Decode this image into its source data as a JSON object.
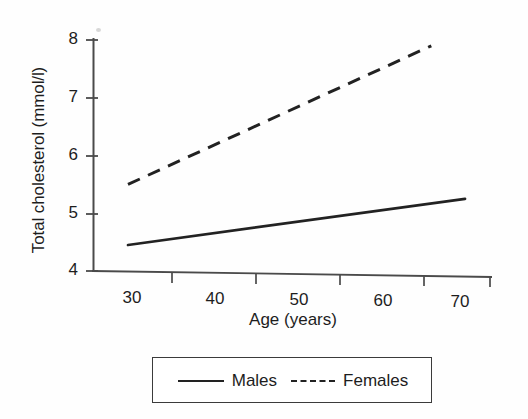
{
  "chart_data": {
    "type": "line",
    "title": "",
    "xlabel": "Age (years)",
    "ylabel": "Total cholesterol (mmol/l)",
    "xlim": [
      25,
      75
    ],
    "ylim": [
      4,
      8
    ],
    "xticks": [
      30,
      40,
      50,
      60,
      70
    ],
    "xtick_labels": [
      "30",
      "40",
      "50",
      "60",
      "70"
    ],
    "yticks": [
      4,
      5,
      6,
      7,
      8
    ],
    "ytick_labels": [
      "4",
      "5",
      "6",
      "7",
      "8"
    ],
    "grid": false,
    "legend_position": "below-axes",
    "series": [
      {
        "name": "Males",
        "style": "solid",
        "color": "#222222",
        "x": [
          30,
          70
        ],
        "values": [
          4.45,
          5.25
        ]
      },
      {
        "name": "Females",
        "style": "dashed",
        "color": "#222222",
        "x": [
          30,
          66
        ],
        "values": [
          5.5,
          7.9
        ]
      }
    ]
  },
  "axes": {
    "y_axis_title": "Total cholesterol (mmol/l)",
    "x_axis_title": "Age (years)",
    "y_tick_labels": [
      "8",
      "7",
      "6",
      "5",
      "4"
    ],
    "x_tick_labels": [
      "30",
      "40",
      "50",
      "60",
      "70"
    ]
  },
  "legend": {
    "entries": [
      {
        "label": "Males",
        "style": "solid"
      },
      {
        "label": "Females",
        "style": "dashed"
      }
    ]
  }
}
